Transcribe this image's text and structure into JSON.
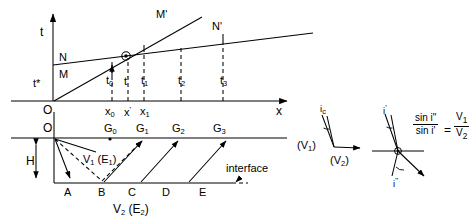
{
  "figure": {
    "type": "seismic-refraction-traveltime-diagram",
    "width": 476,
    "height": 223,
    "stroke_color": "#000000",
    "background": "#ffffff"
  },
  "traveltime_plot": {
    "axis_t_label": "t",
    "axis_x_label": "x",
    "origin_label": "O",
    "intercept_time_label": "t*",
    "branch_labels": {
      "direct_start": "M",
      "direct_end": "M'",
      "refracted_start": "N",
      "refracted_end": "N'"
    },
    "time_ticks": [
      "t",
      "t",
      "t",
      "t",
      "t"
    ],
    "time_tick_labels": [
      {
        "base": "t",
        "sub": "0"
      },
      {
        "base": "t",
        "sup": "'"
      },
      {
        "base": "t",
        "sub": "1"
      },
      {
        "base": "t",
        "sub": "2"
      },
      {
        "base": "t",
        "sub": "3"
      }
    ],
    "distance_tick_labels": [
      {
        "base": "x",
        "sub": "0"
      },
      {
        "base": "x",
        "sup": "'"
      },
      {
        "base": "x",
        "sub": "1"
      }
    ],
    "crossover_marker": "crossover-point"
  },
  "ray_diagram": {
    "origin_label": "O",
    "depth_label": "H",
    "upper_layer_label": {
      "v": "V",
      "v_sub": "1",
      "e": "E",
      "e_sub": "1"
    },
    "lower_layer_label": {
      "v": "V",
      "v_sub": "2",
      "e": "E",
      "e_sub": "2"
    },
    "interface_label": "interface",
    "surface_points": [
      {
        "base": "G",
        "sub": "0"
      },
      {
        "base": "G",
        "sub": "1"
      },
      {
        "base": "G",
        "sub": "2"
      },
      {
        "base": "G",
        "sub": "3"
      }
    ],
    "interface_points": [
      "A",
      "B",
      "C",
      "D",
      "E"
    ]
  },
  "critical_angle_inset": {
    "angle_label": {
      "base": "i",
      "sub": "c"
    },
    "upper_velocity": {
      "base": "V",
      "sub": "1"
    },
    "lower_velocity": {
      "base": "V",
      "sub": "2"
    }
  },
  "snell_inset": {
    "incident_angle_label": {
      "base": "i",
      "sup": "'"
    },
    "refracted_angle_label": {
      "base": "i",
      "sup": "\""
    },
    "equation": {
      "numerator_left": "sin i\"",
      "denominator_left": "sin i'",
      "equals": "=",
      "numerator_right": {
        "base": "V",
        "sub": "1"
      },
      "denominator_right": {
        "base": "V",
        "sub": "2"
      }
    }
  }
}
